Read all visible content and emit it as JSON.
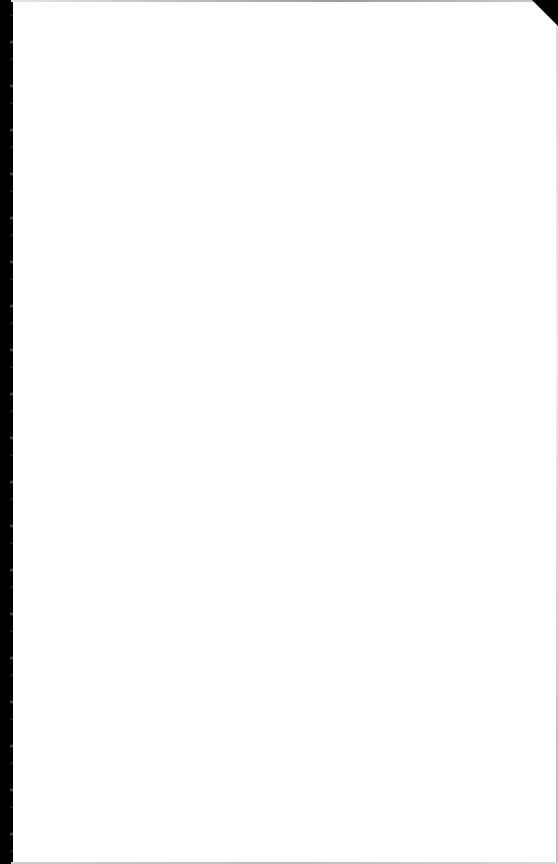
{
  "page": {
    "type": "blank-scanned-page",
    "text": "",
    "colors": {
      "paper": "#ffffff",
      "left_edge": "#000000",
      "corner_fold": "#000000"
    }
  }
}
